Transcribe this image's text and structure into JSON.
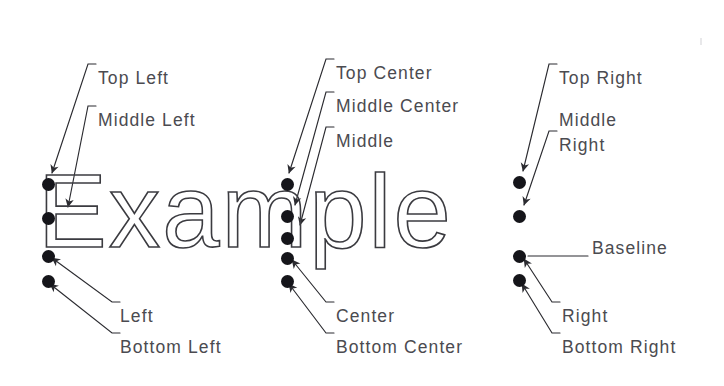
{
  "diagram": {
    "sample_text": "Example",
    "ink_color": "#3b3b40",
    "label_color": "#4b4b50",
    "dot_color": "#15151a",
    "background": "#ffffff",
    "columns": [
      {
        "name": "left",
        "dot_x": 42,
        "labels": [
          {
            "key": "top_left",
            "text": "Top Left",
            "x": 98,
            "y": 68,
            "dot_y": 178
          },
          {
            "key": "middle_left",
            "text": "Middle Left",
            "x": 98,
            "y": 110,
            "dot_y": 212
          },
          {
            "key": "left",
            "text": "Left",
            "x": 120,
            "y": 306,
            "dot_y": 250
          },
          {
            "key": "bottom_left",
            "text": "Bottom Left",
            "x": 120,
            "y": 337,
            "dot_y": 275
          }
        ]
      },
      {
        "name": "center",
        "dot_x": 281,
        "labels": [
          {
            "key": "top_center",
            "text": "Top Center",
            "x": 336,
            "y": 63,
            "dot_y": 178
          },
          {
            "key": "middle_center",
            "text": "Middle Center",
            "x": 336,
            "y": 96,
            "dot_y": 210
          },
          {
            "key": "middle",
            "text": "Middle",
            "x": 336,
            "y": 131,
            "dot_y": 232
          },
          {
            "key": "center",
            "text": "Center",
            "x": 336,
            "y": 306,
            "dot_y": 252
          },
          {
            "key": "bottom_center",
            "text": "Bottom Center",
            "x": 336,
            "y": 337,
            "dot_y": 275
          }
        ]
      },
      {
        "name": "right",
        "dot_x": 513,
        "labels": [
          {
            "key": "top_right",
            "text": "Top Right",
            "x": 559,
            "y": 68,
            "dot_y": 176
          },
          {
            "key": "middle_right",
            "text": "Middle\nRight",
            "x": 559,
            "y": 108,
            "dot_y": 210
          },
          {
            "key": "baseline",
            "text": "Baseline",
            "x": 592,
            "y": 238,
            "dot_y": 250
          },
          {
            "key": "right",
            "text": "Right",
            "x": 562,
            "y": 306,
            "dot_y": 250
          },
          {
            "key": "bottom_right",
            "text": "Bottom Right",
            "x": 562,
            "y": 337,
            "dot_y": 275
          }
        ]
      }
    ]
  }
}
